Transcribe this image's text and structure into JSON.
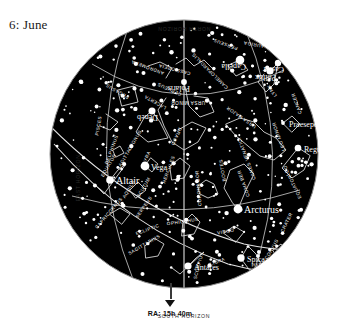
{
  "page": {
    "title": "6: June",
    "background_color": "#ffffff",
    "ink_color": "#111111"
  },
  "chart_data": {
    "type": "scatter",
    "title": "6: June",
    "subtitle": "",
    "xlabel": "",
    "ylabel": "",
    "projection": "all-sky planisphere (circular horizon)",
    "grid": true,
    "legend_position": "none",
    "sky_fill": "#000000",
    "star_color": "#ffffff",
    "line_color": "#d8d8d8",
    "center_x": 136,
    "center_y": 136,
    "radius": 134,
    "horizon_labels": {
      "north": "NORTH HORIZON",
      "south": "SOUTH HORIZON",
      "east": "EAST HORIZON",
      "west": "WEST HORIZON"
    },
    "meridian_label": "RA: 15h 40m",
    "reference_lines": [
      {
        "name": "EQUATOR",
        "label": "EQUATOR"
      },
      {
        "name": "ECLIPTIC",
        "label": "ECLIPTIC"
      },
      {
        "name": "MERIDIAN",
        "label": ""
      }
    ],
    "named_stars": [
      {
        "name": "Polaris",
        "x": 136,
        "y": 64,
        "mag": 2.0,
        "flip": true
      },
      {
        "name": "Vega",
        "x": 97,
        "y": 148,
        "mag": 0.0,
        "flip": false
      },
      {
        "name": "Deneb",
        "x": 104,
        "y": 93,
        "mag": 1.2,
        "flip": true
      },
      {
        "name": "Altair",
        "x": 62,
        "y": 162,
        "mag": 0.8,
        "flip": false
      },
      {
        "name": "Arcturus",
        "x": 190,
        "y": 191,
        "mag": 0.0,
        "flip": false
      },
      {
        "name": "Spica",
        "x": 193,
        "y": 240,
        "mag": 1.0,
        "flip": false
      },
      {
        "name": "Antares",
        "x": 140,
        "y": 248,
        "mag": 1.1,
        "flip": false
      },
      {
        "name": "Regulus",
        "x": 250,
        "y": 130,
        "mag": 1.4,
        "flip": false
      },
      {
        "name": "Capella",
        "x": 192,
        "y": 42,
        "mag": 0.1,
        "flip": true
      },
      {
        "name": "Pollux",
        "x": 222,
        "y": 53,
        "mag": 1.1,
        "flip": true
      },
      {
        "name": "Castor",
        "x": 230,
        "y": 45,
        "mag": 1.6,
        "flip": true
      },
      {
        "name": "Praesepe",
        "x": 235,
        "y": 105,
        "mag": 3.5,
        "flip": false
      }
    ],
    "constellations": [
      {
        "name": "URSA MINOR",
        "x": 140,
        "y": 83,
        "rot": 180
      },
      {
        "name": "URSA MAJOR",
        "x": 194,
        "y": 98,
        "rot": 215
      },
      {
        "name": "DRACO",
        "x": 127,
        "y": 118,
        "rot": 115
      },
      {
        "name": "CEPHEUS",
        "x": 122,
        "y": 70,
        "rot": 205
      },
      {
        "name": "CASSIOPEIA",
        "x": 127,
        "y": 50,
        "rot": 195
      },
      {
        "name": "CAMELOPARDALIS",
        "x": 163,
        "y": 52,
        "rot": 225
      },
      {
        "name": "PERSEUS",
        "x": 178,
        "y": 25,
        "rot": 200
      },
      {
        "name": "AURIGA",
        "x": 206,
        "y": 25,
        "rot": 190
      },
      {
        "name": "LYNX",
        "x": 225,
        "y": 72,
        "rot": 235
      },
      {
        "name": "GEMINI",
        "x": 247,
        "y": 35,
        "rot": 190
      },
      {
        "name": "CANCER",
        "x": 250,
        "y": 85,
        "rot": 250
      },
      {
        "name": "LEO",
        "x": 240,
        "y": 152,
        "rot": 250
      },
      {
        "name": "LEO MINOR",
        "x": 232,
        "y": 118,
        "rot": 250
      },
      {
        "name": "CANES VENATICI",
        "x": 200,
        "y": 140,
        "rot": 250
      },
      {
        "name": "COMA BER",
        "x": 197,
        "y": 165,
        "rot": 250
      },
      {
        "name": "BOOTES",
        "x": 176,
        "y": 152,
        "rot": 260
      },
      {
        "name": "CORONA BOR",
        "x": 152,
        "y": 170,
        "rot": 265
      },
      {
        "name": "HERCULES",
        "x": 122,
        "y": 152,
        "rot": 290
      },
      {
        "name": "LYRA",
        "x": 100,
        "y": 140,
        "rot": 295
      },
      {
        "name": "CYGNUS",
        "x": 88,
        "y": 123,
        "rot": 300
      },
      {
        "name": "LACERTA",
        "x": 108,
        "y": 83,
        "rot": 210
      },
      {
        "name": "ANDROMEDA",
        "x": 100,
        "y": 48,
        "rot": 200
      },
      {
        "name": "PEGASUS",
        "x": 70,
        "y": 72,
        "rot": 210
      },
      {
        "name": "PISCES",
        "x": 52,
        "y": 108,
        "rot": 280
      },
      {
        "name": "DELPHINUS",
        "x": 65,
        "y": 132,
        "rot": 290
      },
      {
        "name": "SAGITTA",
        "x": 77,
        "y": 142,
        "rot": 300
      },
      {
        "name": "AQUILA",
        "x": 82,
        "y": 172,
        "rot": 300
      },
      {
        "name": "SERPENS",
        "x": 97,
        "y": 190,
        "rot": 305
      },
      {
        "name": "SCUTUM",
        "x": 97,
        "y": 170,
        "rot": 300
      },
      {
        "name": "CAPRICORNUS",
        "x": 62,
        "y": 196,
        "rot": 310
      },
      {
        "name": "SAGITTARIUS",
        "x": 97,
        "y": 228,
        "rot": 330
      },
      {
        "name": "OPHIUCHUS",
        "x": 135,
        "y": 205,
        "rot": 352
      },
      {
        "name": "SCORPIUS",
        "x": 152,
        "y": 248,
        "rot": 285
      },
      {
        "name": "LIBRA",
        "x": 170,
        "y": 245,
        "rot": 340
      },
      {
        "name": "VIRGO",
        "x": 178,
        "y": 215,
        "rot": 350
      },
      {
        "name": "CORVUS",
        "x": 225,
        "y": 232,
        "rot": 300
      },
      {
        "name": "CRATER",
        "x": 240,
        "y": 205,
        "rot": 295
      },
      {
        "name": "HYDRA",
        "x": 213,
        "y": 248,
        "rot": 355
      },
      {
        "name": "ECLIPTIC",
        "x": 100,
        "y": 213,
        "rot": 340
      },
      {
        "name": "EQUATOR",
        "x": 62,
        "y": 148,
        "rot": 300
      },
      {
        "name": "EQUATOR",
        "x": 248,
        "y": 168,
        "rot": 245
      }
    ]
  }
}
